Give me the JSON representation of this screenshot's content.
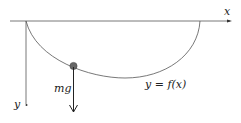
{
  "diagram": {
    "labels": {
      "x_axis": "x",
      "y_axis": "y",
      "force": "mg",
      "curve": "y = f(x)"
    },
    "colors": {
      "line": "#555555",
      "ball": "#666666",
      "arrow": "#222222"
    }
  }
}
